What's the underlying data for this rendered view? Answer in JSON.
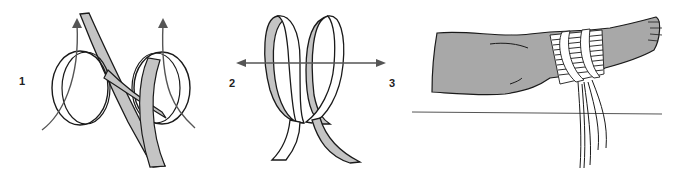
{
  "figure": {
    "panels": [
      {
        "id": "step-1-loops",
        "step_label": "1"
      },
      {
        "id": "step-2-3-overlap",
        "step_labels": [
          "2",
          "3"
        ]
      },
      {
        "id": "applied-to-leg"
      }
    ],
    "colors": {
      "strap_fill": "#c4c4c4",
      "strap_back": "#ffffff",
      "outline": "#1a1a1a",
      "arrow": "#555555",
      "leg_fill": "#a8a8a8",
      "background": "#ffffff"
    }
  }
}
